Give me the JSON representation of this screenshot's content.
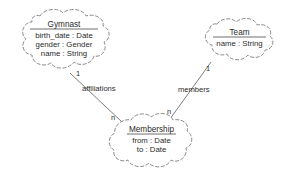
{
  "diagram": {
    "type": "uml-class-cloud-diagram",
    "nodes": [
      {
        "id": "gymnast",
        "title": "Gymnast",
        "attributes": [
          "birth_date : Date",
          "gender : Gender",
          "name : String"
        ]
      },
      {
        "id": "team",
        "title": "Team",
        "attributes": [
          "name : String"
        ]
      },
      {
        "id": "membership",
        "title": "Membership",
        "attributes": [
          "from : Date",
          "to : Date"
        ]
      }
    ],
    "edges": [
      {
        "id": "affiliations",
        "label": "affiliations",
        "source": "gymnast",
        "target": "membership",
        "source_cardinality": "1",
        "target_cardinality": "n"
      },
      {
        "id": "members",
        "label": "members",
        "source": "team",
        "target": "membership",
        "source_cardinality": "1",
        "target_cardinality": "n"
      }
    ],
    "colors": {
      "stroke": "#7d7d7d",
      "text": "#2b2b2b",
      "background": "#ffffff"
    }
  }
}
